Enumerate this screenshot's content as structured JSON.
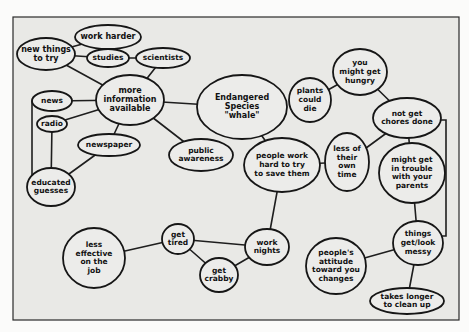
{
  "diagram": {
    "type": "concept-map",
    "central_topic": "Endangered Species \"whale\"",
    "colors": {
      "background": "#fbfbfa",
      "frame_fill": "#e9e9e6",
      "stroke": "#161616",
      "node_fill": "#ececea",
      "text": "#111111"
    },
    "frame": {
      "x": 13,
      "y": 17,
      "w": 446,
      "h": 303
    },
    "nodes": [
      {
        "id": "new-things-to-try",
        "lines": [
          "new things",
          "to try"
        ],
        "cx": 46,
        "cy": 54,
        "rx": 29,
        "ry": 16,
        "fs": 8
      },
      {
        "id": "work-harder",
        "lines": [
          "work harder"
        ],
        "cx": 108,
        "cy": 37,
        "rx": 33,
        "ry": 12,
        "fs": 8
      },
      {
        "id": "studies",
        "lines": [
          "studies"
        ],
        "cx": 108,
        "cy": 58,
        "rx": 21,
        "ry": 9,
        "fs": 7.5
      },
      {
        "id": "scientists",
        "lines": [
          "scientists"
        ],
        "cx": 163,
        "cy": 58,
        "rx": 27,
        "ry": 10,
        "fs": 7.5
      },
      {
        "id": "more-information-available",
        "lines": [
          "more",
          "information",
          "available"
        ],
        "cx": 130,
        "cy": 100,
        "rx": 34,
        "ry": 25,
        "fs": 8
      },
      {
        "id": "news",
        "lines": [
          "news"
        ],
        "cx": 52,
        "cy": 101,
        "rx": 20,
        "ry": 10,
        "fs": 7.5
      },
      {
        "id": "radio",
        "lines": [
          "radio"
        ],
        "cx": 52,
        "cy": 124,
        "rx": 15,
        "ry": 8,
        "fs": 7.5
      },
      {
        "id": "newspaper",
        "lines": [
          "newspaper"
        ],
        "cx": 109,
        "cy": 145,
        "rx": 31,
        "ry": 11,
        "fs": 7.5
      },
      {
        "id": "educated-guesses",
        "lines": [
          "educated",
          "guesses"
        ],
        "cx": 51,
        "cy": 187,
        "rx": 24,
        "ry": 19,
        "fs": 7.5
      },
      {
        "id": "endangered-species-whale",
        "lines": [
          "Endangered",
          "Species",
          "\"whale\""
        ],
        "cx": 242,
        "cy": 107,
        "rx": 45,
        "ry": 32,
        "fs": 8
      },
      {
        "id": "public-awareness",
        "lines": [
          "public",
          "awareness"
        ],
        "cx": 201,
        "cy": 155,
        "rx": 32,
        "ry": 16,
        "fs": 7.5
      },
      {
        "id": "people-work-hard",
        "lines": [
          "people work",
          "hard to try",
          "to save them"
        ],
        "cx": 282,
        "cy": 165,
        "rx": 38,
        "ry": 27,
        "fs": 7.5
      },
      {
        "id": "plants-could-die",
        "lines": [
          "plants",
          "could",
          "die"
        ],
        "cx": 310,
        "cy": 100,
        "rx": 21,
        "ry": 22,
        "fs": 7.5
      },
      {
        "id": "you-might-get-hungry",
        "lines": [
          "you",
          "might get",
          "hungry"
        ],
        "cx": 360,
        "cy": 72,
        "rx": 27,
        "ry": 23,
        "fs": 7.5
      },
      {
        "id": "not-get-chores-done",
        "lines": [
          "not get",
          "chores done"
        ],
        "cx": 407,
        "cy": 118,
        "rx": 34,
        "ry": 20,
        "fs": 7.5
      },
      {
        "id": "less-of-their-own-time",
        "lines": [
          "less of",
          "their",
          "own",
          "time"
        ],
        "cx": 347,
        "cy": 162,
        "rx": 22,
        "ry": 29,
        "fs": 7.5
      },
      {
        "id": "might-get-in-trouble",
        "lines": [
          "might get",
          "in trouble",
          "with your",
          "parents"
        ],
        "cx": 412,
        "cy": 173,
        "rx": 33,
        "ry": 30,
        "fs": 7.5
      },
      {
        "id": "things-get-look-messy",
        "lines": [
          "things",
          "get/look",
          "messy"
        ],
        "cx": 418,
        "cy": 243,
        "rx": 25,
        "ry": 22,
        "fs": 7.5
      },
      {
        "id": "peoples-attitude",
        "lines": [
          "people's",
          "attitude",
          "toward you",
          "changes"
        ],
        "cx": 336,
        "cy": 266,
        "rx": 30,
        "ry": 28,
        "fs": 7.5
      },
      {
        "id": "takes-longer-to-clean-up",
        "lines": [
          "takes longer",
          "to clean up"
        ],
        "cx": 407,
        "cy": 301,
        "rx": 37,
        "ry": 13,
        "fs": 7.5
      },
      {
        "id": "work-nights",
        "lines": [
          "work",
          "nights"
        ],
        "cx": 267,
        "cy": 247,
        "rx": 22,
        "ry": 18,
        "fs": 7.5
      },
      {
        "id": "get-tired",
        "lines": [
          "get",
          "tired"
        ],
        "cx": 178,
        "cy": 239,
        "rx": 16,
        "ry": 15,
        "fs": 7.5
      },
      {
        "id": "get-crabby",
        "lines": [
          "get",
          "crabby"
        ],
        "cx": 219,
        "cy": 275,
        "rx": 19,
        "ry": 17,
        "fs": 7.5
      },
      {
        "id": "less-effective-on-the-job",
        "lines": [
          "less",
          "effective",
          "on the",
          "job"
        ],
        "cx": 94,
        "cy": 258,
        "rx": 31,
        "ry": 30,
        "fs": 7.5
      }
    ],
    "edges": [
      {
        "from": "new-things-to-try",
        "to": "work-harder"
      },
      {
        "from": "new-things-to-try",
        "to": "studies"
      },
      {
        "from": "studies",
        "to": "scientists"
      },
      {
        "from": "new-things-to-try",
        "to": "more-information-available"
      },
      {
        "from": "scientists",
        "to": "more-information-available"
      },
      {
        "from": "news",
        "to": "more-information-available"
      },
      {
        "from": "radio",
        "to": "more-information-available"
      },
      {
        "from": "newspaper",
        "to": "more-information-available"
      },
      {
        "from": "more-information-available",
        "to": "endangered-species-whale"
      },
      {
        "from": "more-information-available",
        "to": "public-awareness"
      },
      {
        "from": "radio",
        "to": "educated-guesses"
      },
      {
        "from": "newspaper",
        "to": "educated-guesses"
      },
      {
        "from": "endangered-species-whale",
        "to": "people-work-hard"
      },
      {
        "from": "people-work-hard",
        "to": "less-of-their-own-time"
      },
      {
        "from": "people-work-hard",
        "to": "work-nights"
      },
      {
        "from": "less-of-their-own-time",
        "to": "not-get-chores-done"
      },
      {
        "from": "not-get-chores-done",
        "to": "you-might-get-hungry"
      },
      {
        "from": "you-might-get-hungry",
        "to": "plants-could-die"
      },
      {
        "from": "not-get-chores-done",
        "to": "might-get-in-trouble"
      },
      {
        "from": "might-get-in-trouble",
        "to": "things-get-look-messy"
      },
      {
        "from": "things-get-look-messy",
        "to": "peoples-attitude"
      },
      {
        "from": "things-get-look-messy",
        "to": "takes-longer-to-clean-up"
      },
      {
        "from": "work-nights",
        "to": "get-tired"
      },
      {
        "from": "work-nights",
        "to": "get-crabby"
      },
      {
        "from": "get-tired",
        "to": "get-crabby"
      },
      {
        "from": "get-tired",
        "to": "less-effective-on-the-job"
      }
    ],
    "polylines": [
      {
        "id": "news-to-educated-guesses",
        "points": [
          [
            32,
            101
          ],
          [
            32,
            180
          ]
        ]
      },
      {
        "id": "chores-to-messy-bracket",
        "points": [
          [
            440,
            120
          ],
          [
            446,
            120
          ],
          [
            446,
            236
          ],
          [
            442,
            236
          ]
        ]
      }
    ]
  }
}
